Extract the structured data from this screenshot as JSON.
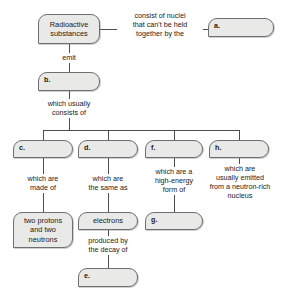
{
  "diagram": {
    "colors": {
      "box_fill": "#e9e9e7",
      "box_border": "#6f6f6f",
      "line": "#3a3a3a",
      "text": "#1b1b1b",
      "background": "#ffffff"
    },
    "nodes": [
      {
        "id": "root",
        "text": "Radioactive\nsubstances",
        "blank": false,
        "x": 38,
        "y": 14,
        "w": 62,
        "h": 30
      },
      {
        "id": "a",
        "text": "a.",
        "blank": true,
        "x": 208,
        "y": 18,
        "w": 66,
        "h": 19
      },
      {
        "id": "b",
        "text": "b.",
        "blank": true,
        "x": 38,
        "y": 72,
        "w": 62,
        "h": 19
      },
      {
        "id": "c",
        "text": "c.",
        "blank": true,
        "x": 13,
        "y": 140,
        "w": 60,
        "h": 18
      },
      {
        "id": "d",
        "text": "d.",
        "blank": true,
        "x": 78,
        "y": 140,
        "w": 60,
        "h": 18
      },
      {
        "id": "f",
        "text": "f.",
        "blank": true,
        "x": 145,
        "y": 140,
        "w": 58,
        "h": 18
      },
      {
        "id": "h",
        "text": "h.",
        "blank": true,
        "x": 209,
        "y": 140,
        "w": 60,
        "h": 18
      },
      {
        "id": "protons",
        "text": "two protons\nand two\nneutrons",
        "blank": false,
        "x": 13,
        "y": 212,
        "w": 60,
        "h": 36
      },
      {
        "id": "electrons",
        "text": "electrons",
        "blank": false,
        "x": 78,
        "y": 212,
        "w": 60,
        "h": 18
      },
      {
        "id": "g",
        "text": "g.",
        "blank": true,
        "x": 145,
        "y": 212,
        "w": 58,
        "h": 18
      },
      {
        "id": "e",
        "text": "e.",
        "blank": true,
        "x": 78,
        "y": 268,
        "w": 60,
        "h": 19
      }
    ],
    "connector_labels": [
      {
        "id": "consist-of-nuclei",
        "text": "consist of nuclei\nthat can't be held\ntogether by the",
        "x": 118,
        "y": 11,
        "w": 84
      },
      {
        "id": "emit",
        "text": "emit",
        "x": 44,
        "y": 53,
        "w": 50
      },
      {
        "id": "which-usually-consists-of",
        "text": "which usually\nconsists of",
        "x": 42,
        "y": 99,
        "w": 54
      },
      {
        "id": "which-are-made-of",
        "text": "which are\nmade of",
        "x": 15,
        "y": 174,
        "w": 56
      },
      {
        "id": "which-are-the-same-as",
        "text": "which are\nthe same as",
        "x": 80,
        "y": 174,
        "w": 56
      },
      {
        "id": "which-are-a-high-energy-form-of",
        "text": "which are a\nhigh-energy\nform of",
        "x": 146,
        "y": 167,
        "w": 56
      },
      {
        "id": "which-are-usually-emitted",
        "text": "which are\nusually emitted\nfrom a neutron-rich\nnucleus",
        "x": 205,
        "y": 164,
        "w": 70
      },
      {
        "id": "produced-by-the-decay-of",
        "text": "produced by\nthe decay of",
        "x": 80,
        "y": 236,
        "w": 56
      }
    ],
    "edges": [
      {
        "id": "root-to-a",
        "from": "root",
        "to": "a"
      },
      {
        "id": "root-to-b",
        "from": "root",
        "to": "b"
      },
      {
        "id": "b-to-branch",
        "from": "b",
        "to": "branch-bus"
      },
      {
        "id": "branch-to-c",
        "from": "branch-bus",
        "to": "c"
      },
      {
        "id": "branch-to-d",
        "from": "branch-bus",
        "to": "d"
      },
      {
        "id": "branch-to-f",
        "from": "branch-bus",
        "to": "f"
      },
      {
        "id": "branch-to-h",
        "from": "branch-bus",
        "to": "h"
      },
      {
        "id": "c-to-protons",
        "from": "c",
        "to": "protons"
      },
      {
        "id": "d-to-electrons",
        "from": "d",
        "to": "electrons"
      },
      {
        "id": "f-to-g",
        "from": "f",
        "to": "g"
      },
      {
        "id": "electrons-to-e",
        "from": "electrons",
        "to": "e"
      }
    ]
  }
}
